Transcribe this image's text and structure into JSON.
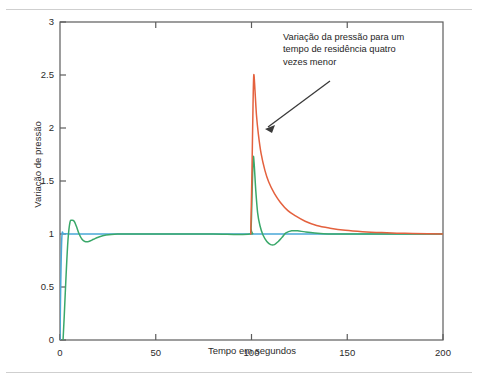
{
  "page": {
    "clipped_header_text": "",
    "background_color": "#ffffff"
  },
  "annotation": {
    "line1": "Variação da pressão para um",
    "line2": "tempo de residência quatro",
    "line3": "vezes menor",
    "arrow_name": "annotation-arrow"
  },
  "chart_data": {
    "type": "line",
    "title": "",
    "xlabel": "Tempo em segundos",
    "ylabel": "Variação de pressão",
    "xlim": [
      0,
      200
    ],
    "ylim": [
      0,
      3
    ],
    "xticks": [
      0,
      50,
      100,
      150,
      200
    ],
    "xtick_labels": [
      "0",
      "50",
      "100",
      "150",
      "200"
    ],
    "yticks": [
      0,
      0.5,
      1,
      1.5,
      2,
      2.5,
      3
    ],
    "ytick_labels": [
      "0",
      "0.5",
      "1",
      "1.5",
      "2",
      "2.5",
      "3"
    ],
    "grid": false,
    "legend": null,
    "frame": true,
    "series": [
      {
        "name": "degrau-azul",
        "color": "#4aa8d8",
        "description": "Degrau em t=0 subindo de 0 a 1, permanecendo constante em 1 ate t=200",
        "x": [
          0,
          0.4,
          1.0,
          2.0,
          5,
          20,
          50,
          99.6,
          100,
          101,
          105,
          120,
          160,
          200
        ],
        "y": [
          0,
          0.55,
          0.98,
          1.0,
          1.0,
          1.0,
          1.0,
          1.0,
          1.0,
          1.0,
          1.0,
          1.0,
          1.0,
          1.0
        ]
      },
      {
        "name": "resposta-verde",
        "color": "#3aa86a",
        "description": "Resposta com sobre-sinal inicial ate 1.13 e pico de 1.72 em t=101 com pequeno sub-sinal",
        "x": [
          1.6,
          2.2,
          3.2,
          4.2,
          5.2,
          6.2,
          7.4,
          8.6,
          10.0,
          11.5,
          13.0,
          15.0,
          17.5,
          20.0,
          24.0,
          30.0,
          40.0,
          60.0,
          80.0,
          99.0,
          99.8,
          100.4,
          100.9,
          101.4,
          102.2,
          103.2,
          104.4,
          106.0,
          108.0,
          110.0,
          112.0,
          114.0,
          116.0,
          118.0,
          121.0,
          124.0,
          128.0,
          133.0,
          140.0,
          150.0,
          165.0,
          185.0,
          200.0
        ],
        "y": [
          0.0,
          0.22,
          0.62,
          0.95,
          1.11,
          1.13,
          1.12,
          1.07,
          1.0,
          0.95,
          0.93,
          0.93,
          0.95,
          0.97,
          0.99,
          1.0,
          1.0,
          1.0,
          1.0,
          1.0,
          1.06,
          1.45,
          1.72,
          1.66,
          1.42,
          1.2,
          1.08,
          0.99,
          0.93,
          0.9,
          0.9,
          0.93,
          0.97,
          1.01,
          1.03,
          1.03,
          1.02,
          1.01,
          1.0,
          1.0,
          1.0,
          1.0,
          1.0
        ]
      },
      {
        "name": "resposta-vermelha",
        "color": "#e4613e",
        "description": "Pico agudo de 2.50 em t=101 com decaimento exponencial lento ate 1.0",
        "x": [
          99.6,
          100.2,
          100.8,
          101.2,
          101.8,
          102.6,
          103.6,
          105.0,
          107.0,
          109.0,
          112.0,
          115.0,
          119.0,
          123.0,
          128.0,
          134.0,
          141.0,
          149.0,
          158.0,
          168.0,
          180.0,
          192.0,
          200.0
        ],
        "y": [
          1.0,
          1.55,
          2.22,
          2.5,
          2.36,
          2.12,
          1.94,
          1.76,
          1.6,
          1.49,
          1.38,
          1.3,
          1.22,
          1.17,
          1.12,
          1.08,
          1.055,
          1.035,
          1.022,
          1.013,
          1.006,
          1.002,
          1.0
        ]
      }
    ]
  },
  "colors": {
    "axis": "#5c5c5c",
    "text": "#2b2b2b",
    "rule": "#cfcfcf",
    "arrow": "#3a3a3a"
  }
}
